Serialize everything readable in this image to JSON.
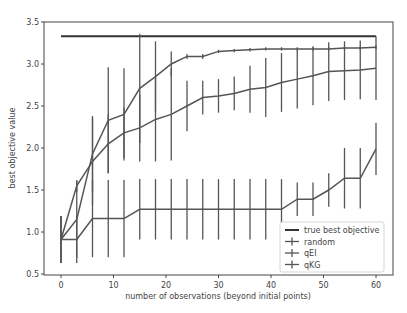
{
  "chart_data": {
    "type": "line",
    "title": "",
    "xlabel": "number of observations (beyond initial points)",
    "ylabel": "best objective value",
    "xlim": [
      -4,
      64
    ],
    "ylim": [
      0.5,
      3.5
    ],
    "xticks": [
      0,
      10,
      20,
      30,
      40,
      50,
      60
    ],
    "yticks": [
      0.5,
      1.0,
      1.5,
      2.0,
      2.5,
      3.0,
      3.5
    ],
    "xtick_labels": [
      "0",
      "10",
      "20",
      "30",
      "40",
      "50",
      "60"
    ],
    "ytick_labels": [
      "0.5",
      "1.0",
      "1.5",
      "2.0",
      "2.5",
      "3.0",
      "3.5"
    ],
    "grid": false,
    "legend_position": "lower right",
    "x": [
      0,
      3,
      6,
      9,
      12,
      15,
      18,
      21,
      24,
      27,
      30,
      33,
      36,
      39,
      42,
      45,
      48,
      51,
      54,
      57,
      60
    ],
    "reference_line": {
      "name": "true best objective",
      "value": 3.33,
      "x_range": [
        0,
        60
      ],
      "color": "#333333"
    },
    "series": [
      {
        "name": "random",
        "color": "#555555",
        "values": [
          0.91,
          0.91,
          1.16,
          1.16,
          1.16,
          1.27,
          1.27,
          1.27,
          1.27,
          1.27,
          1.27,
          1.27,
          1.27,
          1.27,
          1.27,
          1.39,
          1.39,
          1.5,
          1.64,
          1.64,
          1.99
        ],
        "errors": [
          0.28,
          0.28,
          0.46,
          0.46,
          0.46,
          0.36,
          0.36,
          0.36,
          0.36,
          0.36,
          0.36,
          0.36,
          0.36,
          0.36,
          0.36,
          0.2,
          0.2,
          0.2,
          0.36,
          0.36,
          0.31
        ]
      },
      {
        "name": "qEI",
        "color": "#555555",
        "values": [
          0.91,
          1.55,
          1.84,
          2.05,
          2.18,
          2.24,
          2.34,
          2.4,
          2.5,
          2.6,
          2.62,
          2.65,
          2.7,
          2.72,
          2.78,
          2.82,
          2.86,
          2.91,
          2.92,
          2.93,
          2.95
        ],
        "errors": [
          0.28,
          0.07,
          0.52,
          0.35,
          0.3,
          0.4,
          0.5,
          0.55,
          0.3,
          0.2,
          0.2,
          0.2,
          0.28,
          0.35,
          0.35,
          0.35,
          0.35,
          0.35,
          0.35,
          0.35,
          0.38
        ]
      },
      {
        "name": "qKG",
        "color": "#555555",
        "values": [
          0.91,
          1.15,
          1.93,
          2.33,
          2.4,
          2.71,
          2.85,
          3.0,
          3.09,
          3.09,
          3.15,
          3.16,
          3.17,
          3.18,
          3.18,
          3.18,
          3.18,
          3.18,
          3.19,
          3.19,
          3.2
        ],
        "errors": [
          0.28,
          0.46,
          0.45,
          0.63,
          0.55,
          0.65,
          0.42,
          0.15,
          0.03,
          0.03,
          0.02,
          0.02,
          0.02,
          0.02,
          0.02,
          0.02,
          0.02,
          0.02,
          0.02,
          0.02,
          0.02
        ]
      }
    ]
  }
}
